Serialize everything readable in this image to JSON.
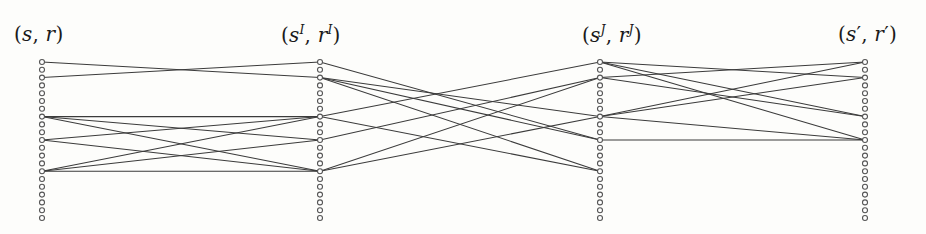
{
  "figure": {
    "type": "layered-bipartite-graph",
    "background_color": "#fdfdfb",
    "ink_color": "#3b3b3b",
    "node_stroke_color": "#555555",
    "width": 926,
    "height": 234,
    "columns": [
      {
        "id": "col-0",
        "label": "(s, r)",
        "label_parts": {
          "open": "(",
          "first": "s",
          "first_sup": "",
          "comma": ", ",
          "second": "r",
          "second_sup": "",
          "close": ")"
        },
        "label_x": 14,
        "label_y": 22,
        "x": 42,
        "node_count": 21,
        "top_y": 62,
        "spacing": 7.8,
        "active_nodes": [
          0,
          2,
          7,
          10,
          14
        ]
      },
      {
        "id": "col-1",
        "label": "(sI, rI)",
        "label_parts": {
          "open": "(",
          "first": "s",
          "first_sup": "I",
          "comma": ", ",
          "second": "r",
          "second_sup": "I",
          "close": ")"
        },
        "label_x": 281,
        "label_y": 22,
        "x": 320,
        "node_count": 21,
        "top_y": 62,
        "spacing": 7.8,
        "active_nodes": [
          0,
          2,
          7,
          10,
          14
        ]
      },
      {
        "id": "col-2",
        "label": "(sJ, rJ)",
        "label_parts": {
          "open": "(",
          "first": "s",
          "first_sup": "J",
          "comma": ", ",
          "second": "r",
          "second_sup": "J",
          "close": ")"
        },
        "label_x": 582,
        "label_y": 22,
        "x": 600,
        "node_count": 21,
        "top_y": 62,
        "spacing": 7.8,
        "active_nodes": [
          0,
          2,
          7,
          10,
          14
        ]
      },
      {
        "id": "col-3",
        "label": "(s', r')",
        "label_parts": {
          "open": "(",
          "first": "s",
          "first_sup": "",
          "prime1": "′",
          "comma": ", ",
          "second": "r",
          "second_sup": "",
          "prime2": "′",
          "close": ")"
        },
        "label_x": 838,
        "label_y": 22,
        "x": 865,
        "node_count": 21,
        "top_y": 62,
        "spacing": 7.8,
        "active_nodes": [
          0,
          2,
          7,
          10,
          14
        ]
      }
    ],
    "edges": [
      {
        "from_col": 0,
        "from_node": 0,
        "to_col": 1,
        "to_node": 2
      },
      {
        "from_col": 0,
        "from_node": 2,
        "to_col": 1,
        "to_node": 0
      },
      {
        "from_col": 0,
        "from_node": 7,
        "to_col": 1,
        "to_node": 7
      },
      {
        "from_col": 0,
        "from_node": 7,
        "to_col": 1,
        "to_node": 10
      },
      {
        "from_col": 0,
        "from_node": 7,
        "to_col": 1,
        "to_node": 14
      },
      {
        "from_col": 0,
        "from_node": 10,
        "to_col": 1,
        "to_node": 7
      },
      {
        "from_col": 0,
        "from_node": 10,
        "to_col": 1,
        "to_node": 14
      },
      {
        "from_col": 0,
        "from_node": 14,
        "to_col": 1,
        "to_node": 7
      },
      {
        "from_col": 0,
        "from_node": 14,
        "to_col": 1,
        "to_node": 10
      },
      {
        "from_col": 0,
        "from_node": 14,
        "to_col": 1,
        "to_node": 14
      },
      {
        "from_col": 1,
        "from_node": 0,
        "to_col": 2,
        "to_node": 10
      },
      {
        "from_col": 1,
        "from_node": 2,
        "to_col": 2,
        "to_node": 7
      },
      {
        "from_col": 1,
        "from_node": 2,
        "to_col": 2,
        "to_node": 10
      },
      {
        "from_col": 1,
        "from_node": 2,
        "to_col": 2,
        "to_node": 14
      },
      {
        "from_col": 1,
        "from_node": 7,
        "to_col": 2,
        "to_node": 0
      },
      {
        "from_col": 1,
        "from_node": 7,
        "to_col": 2,
        "to_node": 14
      },
      {
        "from_col": 1,
        "from_node": 10,
        "to_col": 2,
        "to_node": 2
      },
      {
        "from_col": 1,
        "from_node": 14,
        "to_col": 2,
        "to_node": 2
      },
      {
        "from_col": 1,
        "from_node": 14,
        "to_col": 2,
        "to_node": 7
      },
      {
        "from_col": 2,
        "from_node": 0,
        "to_col": 3,
        "to_node": 2
      },
      {
        "from_col": 2,
        "from_node": 0,
        "to_col": 3,
        "to_node": 7
      },
      {
        "from_col": 2,
        "from_node": 0,
        "to_col": 3,
        "to_node": 10
      },
      {
        "from_col": 2,
        "from_node": 2,
        "to_col": 3,
        "to_node": 0
      },
      {
        "from_col": 2,
        "from_node": 2,
        "to_col": 3,
        "to_node": 7
      },
      {
        "from_col": 2,
        "from_node": 7,
        "to_col": 3,
        "to_node": 0
      },
      {
        "from_col": 2,
        "from_node": 7,
        "to_col": 3,
        "to_node": 2
      },
      {
        "from_col": 2,
        "from_node": 7,
        "to_col": 3,
        "to_node": 10
      },
      {
        "from_col": 2,
        "from_node": 10,
        "to_col": 3,
        "to_node": 10
      }
    ]
  }
}
